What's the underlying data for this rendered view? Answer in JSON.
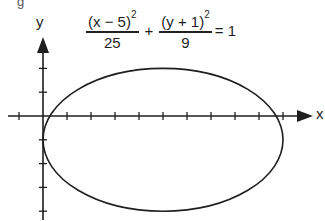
{
  "chart_data": {
    "type": "line",
    "equation": {
      "term1": {
        "numerator": "(x − 5)",
        "exponent": "2",
        "denominator": "25"
      },
      "operator": "+",
      "term2": {
        "numerator": "(y + 1)",
        "exponent": "2",
        "denominator": "9"
      },
      "rhs": "= 1"
    },
    "xlabel": "x",
    "ylabel": "y",
    "xlim": [
      -1.5,
      11
    ],
    "ylim": [
      -4,
      3.3
    ],
    "tick_spacing": 1,
    "x_ticks": [
      -1,
      1,
      2,
      3,
      4,
      5,
      6,
      7,
      8,
      9,
      10
    ],
    "y_ticks": [
      2,
      1,
      -1,
      -2,
      -3,
      -4
    ],
    "grid": false,
    "legend": null,
    "series": [
      {
        "name": "ellipse",
        "shape": "ellipse",
        "center": [
          5,
          -1
        ],
        "semi_major_x": 5,
        "semi_minor_y": 3,
        "vertices": [
          [
            0,
            -1
          ],
          [
            10,
            -1
          ],
          [
            5,
            2
          ],
          [
            5,
            -4
          ]
        ]
      }
    ]
  },
  "figure": {
    "partial_glyph_top": "g",
    "colors": {
      "ink": "#1f1f1f",
      "background": "#ffffff"
    }
  }
}
